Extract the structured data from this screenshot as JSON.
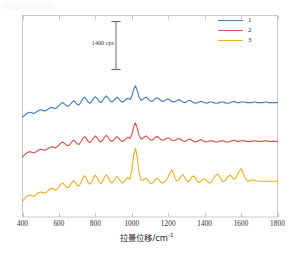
{
  "chart_data": {
    "type": "line",
    "title": "",
    "xlabel": "拉曼位移/cm⁻¹",
    "xlabel_base": "拉曼位移/cm",
    "xlabel_sup": "-1",
    "ylabel": "",
    "xlim": [
      400,
      1800
    ],
    "xticks": [
      400,
      600,
      800,
      1000,
      1200,
      1400,
      1600,
      1800
    ],
    "xticklabels": [
      "400",
      "600",
      "800",
      "1000",
      "1200",
      "1400",
      "1600",
      "1800"
    ],
    "yticks": [],
    "yticklabels": [],
    "grid": false,
    "y_axis_visible_ticks": false,
    "legend_position": "top-right",
    "scalebar": {
      "label": "1400 cps",
      "value": 1400,
      "unit": "cps",
      "x_cm1": 880,
      "y_top_px": 21,
      "y_bottom_px": 70
    },
    "series": [
      {
        "name": "1",
        "label": "1",
        "color": "#4A7EBB",
        "baseline_px": 117,
        "x": [
          400,
          410,
          420,
          430,
          440,
          450,
          460,
          470,
          480,
          490,
          500,
          510,
          520,
          530,
          540,
          550,
          560,
          570,
          580,
          590,
          600,
          610,
          620,
          630,
          640,
          650,
          660,
          670,
          680,
          690,
          700,
          710,
          720,
          730,
          740,
          750,
          760,
          770,
          780,
          790,
          800,
          810,
          820,
          830,
          840,
          850,
          860,
          870,
          880,
          890,
          900,
          910,
          920,
          930,
          940,
          950,
          960,
          970,
          980,
          990,
          1000,
          1010,
          1020,
          1030,
          1040,
          1050,
          1060,
          1070,
          1080,
          1090,
          1100,
          1110,
          1120,
          1130,
          1140,
          1150,
          1160,
          1170,
          1180,
          1190,
          1200,
          1210,
          1220,
          1230,
          1240,
          1250,
          1260,
          1270,
          1280,
          1290,
          1300,
          1310,
          1320,
          1330,
          1340,
          1350,
          1360,
          1370,
          1380,
          1390,
          1400,
          1410,
          1420,
          1430,
          1440,
          1450,
          1460,
          1470,
          1480,
          1490,
          1500,
          1510,
          1520,
          1530,
          1540,
          1550,
          1560,
          1570,
          1580,
          1590,
          1600,
          1610,
          1620,
          1630,
          1640,
          1650,
          1660,
          1670,
          1680,
          1690,
          1700,
          1710,
          1720,
          1730,
          1740,
          1750,
          1760,
          1770,
          1780,
          1790,
          1800
        ],
        "values": [
          0,
          2,
          5,
          7,
          8,
          7,
          6,
          7,
          9,
          11,
          12,
          11,
          10,
          11,
          13,
          15,
          16,
          15,
          14,
          16,
          19,
          22,
          24,
          22,
          19,
          18,
          20,
          24,
          27,
          25,
          21,
          20,
          24,
          30,
          33,
          30,
          25,
          23,
          26,
          31,
          34,
          31,
          26,
          24,
          27,
          32,
          35,
          32,
          27,
          25,
          27,
          31,
          33,
          30,
          26,
          25,
          27,
          30,
          31,
          29,
          34,
          46,
          52,
          44,
          33,
          28,
          29,
          32,
          33,
          30,
          27,
          26,
          28,
          31,
          32,
          30,
          27,
          26,
          27,
          29,
          30,
          28,
          26,
          25,
          26,
          28,
          29,
          27,
          25,
          24,
          25,
          27,
          28,
          26,
          24,
          23,
          24,
          25,
          26,
          25,
          24,
          23,
          24,
          25,
          25,
          24,
          23,
          23,
          24,
          25,
          25,
          24,
          23,
          23,
          24,
          25,
          26,
          25,
          24,
          24,
          25,
          25,
          25,
          24,
          24,
          24,
          24,
          25,
          25,
          24,
          24,
          24,
          24,
          25,
          25,
          24,
          24,
          24,
          24,
          24,
          24
        ]
      },
      {
        "name": "2",
        "label": "2",
        "color": "#D9534F",
        "baseline_px": 157,
        "x": [
          400,
          410,
          420,
          430,
          440,
          450,
          460,
          470,
          480,
          490,
          500,
          510,
          520,
          530,
          540,
          550,
          560,
          570,
          580,
          590,
          600,
          610,
          620,
          630,
          640,
          650,
          660,
          670,
          680,
          690,
          700,
          710,
          720,
          730,
          740,
          750,
          760,
          770,
          780,
          790,
          800,
          810,
          820,
          830,
          840,
          850,
          860,
          870,
          880,
          890,
          900,
          910,
          920,
          930,
          940,
          950,
          960,
          970,
          980,
          990,
          1000,
          1010,
          1020,
          1030,
          1040,
          1050,
          1060,
          1070,
          1080,
          1090,
          1100,
          1110,
          1120,
          1130,
          1140,
          1150,
          1160,
          1170,
          1180,
          1190,
          1200,
          1210,
          1220,
          1230,
          1240,
          1250,
          1260,
          1270,
          1280,
          1290,
          1300,
          1310,
          1320,
          1330,
          1340,
          1350,
          1360,
          1370,
          1380,
          1390,
          1400,
          1410,
          1420,
          1430,
          1440,
          1450,
          1460,
          1470,
          1480,
          1490,
          1500,
          1510,
          1520,
          1530,
          1540,
          1550,
          1560,
          1570,
          1580,
          1590,
          1600,
          1610,
          1620,
          1630,
          1640,
          1650,
          1660,
          1670,
          1680,
          1690,
          1700,
          1710,
          1720,
          1730,
          1740,
          1750,
          1760,
          1770,
          1780,
          1790,
          1800
        ],
        "values": [
          0,
          3,
          6,
          8,
          9,
          8,
          7,
          8,
          10,
          12,
          13,
          12,
          11,
          12,
          14,
          16,
          17,
          16,
          15,
          17,
          20,
          23,
          25,
          23,
          20,
          19,
          21,
          25,
          28,
          26,
          22,
          21,
          25,
          31,
          34,
          31,
          26,
          24,
          27,
          32,
          35,
          32,
          27,
          25,
          28,
          33,
          36,
          33,
          28,
          26,
          28,
          32,
          34,
          31,
          27,
          26,
          28,
          31,
          33,
          31,
          37,
          50,
          57,
          48,
          36,
          30,
          31,
          34,
          35,
          32,
          29,
          28,
          30,
          33,
          34,
          32,
          29,
          28,
          29,
          31,
          32,
          30,
          28,
          27,
          28,
          30,
          31,
          29,
          27,
          26,
          27,
          29,
          30,
          28,
          26,
          25,
          26,
          28,
          29,
          27,
          26,
          25,
          26,
          27,
          27,
          26,
          25,
          25,
          26,
          27,
          27,
          26,
          25,
          25,
          26,
          27,
          28,
          27,
          26,
          26,
          27,
          27,
          27,
          26,
          26,
          26,
          26,
          27,
          27,
          26,
          26,
          26,
          26,
          27,
          27,
          26,
          26,
          26,
          26,
          26,
          26
        ]
      },
      {
        "name": "3",
        "label": "3",
        "color": "#EDB120",
        "baseline_px": 201,
        "x": [
          400,
          410,
          420,
          430,
          440,
          450,
          460,
          470,
          480,
          490,
          500,
          510,
          520,
          530,
          540,
          550,
          560,
          570,
          580,
          590,
          600,
          610,
          620,
          630,
          640,
          650,
          660,
          670,
          680,
          690,
          700,
          710,
          720,
          730,
          740,
          750,
          760,
          770,
          780,
          790,
          800,
          810,
          820,
          830,
          840,
          850,
          860,
          870,
          880,
          890,
          900,
          910,
          920,
          930,
          940,
          950,
          960,
          970,
          980,
          990,
          1000,
          1010,
          1020,
          1030,
          1040,
          1050,
          1060,
          1070,
          1080,
          1090,
          1100,
          1110,
          1120,
          1130,
          1140,
          1150,
          1160,
          1170,
          1180,
          1190,
          1200,
          1210,
          1220,
          1230,
          1240,
          1250,
          1260,
          1270,
          1280,
          1290,
          1300,
          1310,
          1320,
          1330,
          1340,
          1350,
          1360,
          1370,
          1380,
          1390,
          1400,
          1410,
          1420,
          1430,
          1440,
          1450,
          1460,
          1470,
          1480,
          1490,
          1500,
          1510,
          1520,
          1530,
          1540,
          1550,
          1560,
          1570,
          1580,
          1590,
          1600,
          1610,
          1620,
          1630,
          1640,
          1650,
          1660,
          1670,
          1680,
          1690,
          1700,
          1710,
          1720,
          1730,
          1740,
          1750,
          1760,
          1770,
          1780,
          1790,
          1800
        ],
        "values": [
          0,
          3,
          7,
          9,
          10,
          9,
          8,
          9,
          12,
          14,
          15,
          14,
          13,
          14,
          17,
          20,
          21,
          20,
          18,
          20,
          24,
          28,
          30,
          27,
          23,
          22,
          25,
          30,
          34,
          31,
          26,
          25,
          30,
          38,
          42,
          38,
          31,
          28,
          32,
          39,
          43,
          39,
          32,
          29,
          33,
          40,
          44,
          40,
          33,
          30,
          33,
          38,
          41,
          37,
          32,
          30,
          33,
          37,
          39,
          36,
          52,
          76,
          88,
          72,
          48,
          36,
          34,
          37,
          38,
          34,
          30,
          29,
          32,
          36,
          38,
          35,
          31,
          30,
          32,
          35,
          40,
          47,
          52,
          45,
          36,
          33,
          36,
          41,
          44,
          40,
          34,
          32,
          35,
          40,
          42,
          38,
          33,
          31,
          33,
          36,
          37,
          34,
          31,
          30,
          33,
          38,
          42,
          45,
          42,
          36,
          32,
          33,
          37,
          41,
          43,
          40,
          36,
          38,
          44,
          50,
          54,
          48,
          40,
          35,
          33,
          34,
          35,
          35,
          34,
          33,
          33,
          33,
          33,
          33,
          33,
          33,
          33,
          33,
          33,
          33,
          33
        ]
      }
    ]
  },
  "legend": {
    "items": [
      {
        "label": "1",
        "color": "#4A7EBB"
      },
      {
        "label": "2",
        "color": "#D9534F"
      },
      {
        "label": "3",
        "color": "#EDB120"
      }
    ]
  },
  "axes": {
    "frame_color": "#c9c9c9"
  }
}
